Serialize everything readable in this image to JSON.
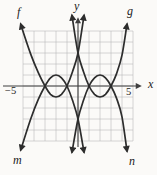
{
  "figure": {
    "curve_labels": {
      "f": "f",
      "g": "g",
      "m": "m",
      "n": "n"
    },
    "axis_labels": {
      "x": "x",
      "y": "y"
    },
    "tick_labels": {
      "left": "−5",
      "right": "5"
    },
    "colors": {
      "curve": "#2d2d2d",
      "axis": "#3f3f3f",
      "grid": "#b5b5b5",
      "background": "#fbfaf8",
      "label": "#1b1b1b"
    }
  },
  "chart_data": {
    "type": "line",
    "axes": {
      "xlabel": "x",
      "ylabel": "y",
      "xlim": [
        -5,
        5
      ],
      "ylim": [
        -5,
        5
      ],
      "grid": true,
      "labeled_xticks": [
        -5,
        5
      ]
    },
    "series": [
      {
        "name": "f",
        "description": "opens upward, vertex (-2,-1), x-intercepts -3 and -1, y-intercept 3, label at top-left end",
        "points": [
          [
            -5.2,
            5.6
          ],
          [
            -4.3,
            2.9
          ],
          [
            -3.6,
            1.2
          ],
          [
            -3,
            0
          ],
          [
            -2.5,
            -0.75
          ],
          [
            -2,
            -1
          ],
          [
            -1.5,
            -0.75
          ],
          [
            -1,
            0
          ],
          [
            -0.5,
            1.3
          ],
          [
            0,
            3
          ],
          [
            0.55,
            6.4
          ]
        ]
      },
      {
        "name": "g",
        "description": "opens upward, vertex (2,-1), x-intercepts 1 and 3, y-intercept 3, label at top-right end",
        "points": [
          [
            -0.55,
            6.4
          ],
          [
            0,
            3
          ],
          [
            0.5,
            1.3
          ],
          [
            1,
            0
          ],
          [
            1.5,
            -0.75
          ],
          [
            2,
            -1
          ],
          [
            2.5,
            -0.75
          ],
          [
            3,
            0
          ],
          [
            3.5,
            1.1
          ],
          [
            4.0,
            2.8
          ],
          [
            4.45,
            5.6
          ]
        ]
      },
      {
        "name": "m",
        "description": "opens downward, vertex (-2,1), x-intercepts -3 and -1, y-intercept -3, label at bottom-left end",
        "points": [
          [
            -5.2,
            -5.8
          ],
          [
            -4.3,
            -3.0
          ],
          [
            -3.6,
            -1.2
          ],
          [
            -3,
            0
          ],
          [
            -2.5,
            0.75
          ],
          [
            -2,
            1
          ],
          [
            -1.5,
            0.75
          ],
          [
            -1,
            0
          ],
          [
            -0.5,
            -1.3
          ],
          [
            0,
            -3
          ],
          [
            0.55,
            -6.0
          ]
        ]
      },
      {
        "name": "n",
        "description": "opens downward, vertex (2,1), x-intercepts 1 and 3, y-intercept -3, label at bottom-right end",
        "points": [
          [
            -0.55,
            -6.0
          ],
          [
            0,
            -3
          ],
          [
            0.5,
            -1.3
          ],
          [
            1,
            0
          ],
          [
            1.5,
            0.75
          ],
          [
            2,
            1
          ],
          [
            2.5,
            0.75
          ],
          [
            3,
            0
          ],
          [
            3.5,
            -1.1
          ],
          [
            4.0,
            -2.8
          ],
          [
            4.45,
            -5.9
          ]
        ]
      }
    ],
    "intersections": [
      [
        -3,
        0
      ],
      [
        -1,
        0
      ],
      [
        1,
        0
      ],
      [
        3,
        0
      ],
      [
        0,
        3
      ],
      [
        0,
        -3
      ]
    ],
    "legend": "none"
  }
}
